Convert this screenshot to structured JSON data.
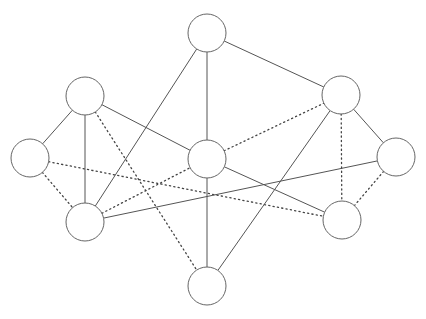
{
  "diagram": {
    "type": "graph",
    "node_radius": 19,
    "colors": {
      "node_stroke": "#666666",
      "node_fill": "#ffffff",
      "edge": "#555555",
      "background": "#ffffff"
    },
    "nodes": [
      {
        "id": "T",
        "x": 207,
        "y": 33
      },
      {
        "id": "UL",
        "x": 85,
        "y": 96
      },
      {
        "id": "UR",
        "x": 341,
        "y": 95
      },
      {
        "id": "L",
        "x": 30,
        "y": 158
      },
      {
        "id": "C",
        "x": 207,
        "y": 159
      },
      {
        "id": "R",
        "x": 396,
        "y": 157
      },
      {
        "id": "LL",
        "x": 85,
        "y": 222
      },
      {
        "id": "LR",
        "x": 342,
        "y": 220
      },
      {
        "id": "B",
        "x": 207,
        "y": 286
      }
    ],
    "edges": [
      {
        "from": "T",
        "to": "LL",
        "style": "solid"
      },
      {
        "from": "T",
        "to": "C",
        "style": "solid"
      },
      {
        "from": "T",
        "to": "UR",
        "style": "solid"
      },
      {
        "from": "UL",
        "to": "L",
        "style": "solid"
      },
      {
        "from": "UL",
        "to": "LL",
        "style": "solid"
      },
      {
        "from": "UL",
        "to": "C",
        "style": "solid"
      },
      {
        "from": "UL",
        "to": "B",
        "style": "dotted"
      },
      {
        "from": "L",
        "to": "LL",
        "style": "dotted"
      },
      {
        "from": "L",
        "to": "LR",
        "style": "dotted"
      },
      {
        "from": "LL",
        "to": "C",
        "style": "dotted"
      },
      {
        "from": "LL",
        "to": "R",
        "style": "solid"
      },
      {
        "from": "C",
        "to": "UR",
        "style": "dotted"
      },
      {
        "from": "C",
        "to": "LR",
        "style": "solid"
      },
      {
        "from": "C",
        "to": "B",
        "style": "solid"
      },
      {
        "from": "UR",
        "to": "R",
        "style": "solid"
      },
      {
        "from": "UR",
        "to": "LR",
        "style": "dotted"
      },
      {
        "from": "UR",
        "to": "B",
        "style": "solid"
      },
      {
        "from": "R",
        "to": "LR",
        "style": "dotted"
      }
    ]
  }
}
